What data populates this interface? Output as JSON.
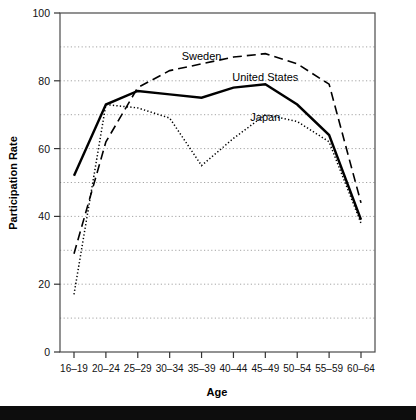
{
  "chart_data": {
    "type": "line",
    "title": "",
    "xlabel": "Age",
    "ylabel": "Participation Rate",
    "categories": [
      "16–19",
      "20–24",
      "25–29",
      "30–34",
      "35–39",
      "40–44",
      "45–49",
      "50–54",
      "55–59",
      "60–64"
    ],
    "ylim": [
      0,
      100
    ],
    "ytick_labels": [
      "0",
      "20",
      "40",
      "60",
      "80",
      "100"
    ],
    "ytick_values": [
      0,
      20,
      40,
      60,
      80,
      100
    ],
    "gridlines": [
      10,
      20,
      30,
      40,
      50,
      60,
      70,
      80,
      90
    ],
    "grid": true,
    "grid_style": "dotted",
    "legend_position": "inline-annotations",
    "series": [
      {
        "name": "Sweden",
        "style": "dashed",
        "color": "#000000",
        "values": [
          29,
          62,
          78,
          83,
          85,
          87,
          88,
          85,
          79,
          44
        ],
        "label_x": "35–39",
        "label_y": 86
      },
      {
        "name": "United States",
        "style": "solid",
        "color": "#000000",
        "values": [
          52,
          73,
          77,
          76,
          75,
          78,
          79,
          73,
          64,
          39
        ],
        "label_x": "45–49",
        "label_y": 80
      },
      {
        "name": "Japan",
        "style": "dotted",
        "color": "#000000",
        "values": [
          17,
          73,
          72,
          69,
          55,
          63,
          70,
          68,
          62,
          38
        ],
        "label_x": "45–49",
        "label_y": 68
      }
    ]
  },
  "footer": {
    "strip_text": ""
  }
}
